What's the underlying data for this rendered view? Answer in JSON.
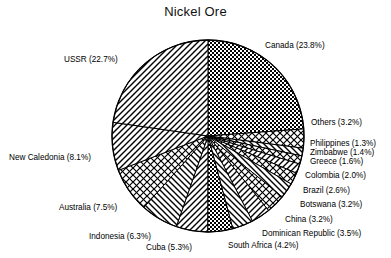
{
  "chart_data": {
    "type": "pie",
    "title": "Nickel Ore",
    "xlabel": "",
    "ylabel": "",
    "legend_position": "none",
    "grid": false,
    "value_unit": "percent",
    "categories": [
      "Canada",
      "Others",
      "Philippines",
      "Zimbabwe",
      "Greece",
      "Colombia",
      "Brazil",
      "Botswana",
      "China",
      "Dominican Republic",
      "South Africa",
      "Cuba",
      "Indonesia",
      "Australia",
      "New Caledonia",
      "USSR"
    ],
    "values": [
      23.8,
      3.2,
      1.3,
      1.4,
      1.6,
      2.0,
      2.6,
      3.2,
      3.2,
      3.5,
      4.2,
      5.3,
      6.3,
      7.5,
      8.1,
      22.7
    ],
    "slices": [
      {
        "label": "Canada (23.8%)",
        "name": "Canada",
        "value": 23.8,
        "pattern": "checker"
      },
      {
        "label": "Others (3.2%)",
        "name": "Others",
        "value": 3.2,
        "pattern": "crosshatch"
      },
      {
        "label": "Philippines (1.3%)",
        "name": "Philippines",
        "value": 1.3,
        "pattern": "diag-right"
      },
      {
        "label": "Zimbabwe (1.4%)",
        "name": "Zimbabwe",
        "value": 1.4,
        "pattern": "crosshatch"
      },
      {
        "label": "Greece (1.6%)",
        "name": "Greece",
        "value": 1.6,
        "pattern": "diag-left"
      },
      {
        "label": "Colombia (2.0%)",
        "name": "Colombia",
        "value": 2.0,
        "pattern": "crosshatch"
      },
      {
        "label": "Brazil (2.6%)",
        "name": "Brazil",
        "value": 2.6,
        "pattern": "diag-right"
      },
      {
        "label": "Botswana (3.2%)",
        "name": "Botswana",
        "value": 3.2,
        "pattern": "crosshatch"
      },
      {
        "label": "China (3.2%)",
        "name": "China",
        "value": 3.2,
        "pattern": "diag-left"
      },
      {
        "label": "Dominican Republic (3.5%)",
        "name": "Dominican Republic",
        "value": 3.5,
        "pattern": "diag-right"
      },
      {
        "label": "South Africa (4.2%)",
        "name": "South Africa",
        "value": 4.2,
        "pattern": "checker"
      },
      {
        "label": "Cuba (5.3%)",
        "name": "Cuba",
        "value": 5.3,
        "pattern": "diag-left"
      },
      {
        "label": "Indonesia (6.3%)",
        "name": "Indonesia",
        "value": 6.3,
        "pattern": "diag-right"
      },
      {
        "label": "Australia (7.5%)",
        "name": "Australia",
        "value": 7.5,
        "pattern": "crosshatch"
      },
      {
        "label": "New Caledonia (8.1%)",
        "name": "New Caledonia",
        "value": 8.1,
        "pattern": "diag-left"
      },
      {
        "label": "USSR (22.7%)",
        "name": "USSR",
        "value": 22.7,
        "pattern": "diag-left"
      }
    ]
  },
  "labels": {
    "title": "Nickel Ore",
    "canada": "Canada (23.8%)",
    "others": "Others (3.2%)",
    "philippines": "Philippines (1.3%)",
    "zimbabwe": "Zimbabwe (1.4%)",
    "greece": "Greece (1.6%)",
    "colombia": "Colombia (2.0%)",
    "brazil": "Brazil (2.6%)",
    "botswana": "Botswana (3.2%)",
    "china": "China (3.2%)",
    "dominican_republic": "Dominican Republic (3.5%)",
    "south_africa": "South Africa (4.2%)",
    "cuba": "Cuba (5.3%)",
    "indonesia": "Indonesia (6.3%)",
    "australia": "Australia (7.5%)",
    "new_caledonia": "New Caledonia (8.1%)",
    "ussr": "USSR (22.7%)"
  },
  "colors": {
    "ink": "#000000",
    "paper": "#ffffff"
  }
}
